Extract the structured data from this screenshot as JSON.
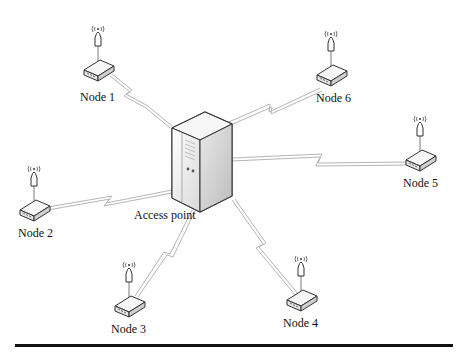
{
  "diagram": {
    "type": "wireless star topology",
    "center": {
      "label": "Access point",
      "x": 188,
      "y": 160
    },
    "nodes": [
      {
        "id": "node-1",
        "label": "Node 1",
        "x": 98,
        "y": 72
      },
      {
        "id": "node-2",
        "label": "Node 2",
        "x": 34,
        "y": 212
      },
      {
        "id": "node-3",
        "label": "Node 3",
        "x": 129,
        "y": 308
      },
      {
        "id": "node-4",
        "label": "Node 4",
        "x": 301,
        "y": 302
      },
      {
        "id": "node-5",
        "label": "Node 5",
        "x": 420,
        "y": 162
      },
      {
        "id": "node-6",
        "label": "Node 6",
        "x": 331,
        "y": 77
      }
    ],
    "link_style": "lightning-bolt wireless link",
    "colors": {
      "line": "#b5b5b5",
      "outline": "#333333",
      "device_fill": "#f2f2f2",
      "rule": "#111111"
    }
  }
}
